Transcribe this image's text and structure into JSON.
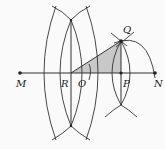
{
  "diagram": {
    "type": "geometric-construction",
    "colors": {
      "line": "#333333",
      "shade": "#c8c8c8",
      "background": "#fafafa"
    },
    "points": [
      {
        "id": "M",
        "label": "M",
        "x": 20,
        "y": 73
      },
      {
        "id": "R",
        "label": "R",
        "x": 71,
        "y": 73
      },
      {
        "id": "O",
        "label": "O",
        "x": 90,
        "y": 73
      },
      {
        "id": "P",
        "label": "P",
        "x": 121,
        "y": 73
      },
      {
        "id": "N",
        "label": "N",
        "x": 155,
        "y": 73
      },
      {
        "id": "Q",
        "label": "Q",
        "x": 121,
        "y": 41
      }
    ],
    "labels": {
      "M": "M",
      "R": "R",
      "O": "O",
      "P": "P",
      "N": "N",
      "Q": "Q"
    },
    "shaded_region": "triangle RPQ"
  }
}
